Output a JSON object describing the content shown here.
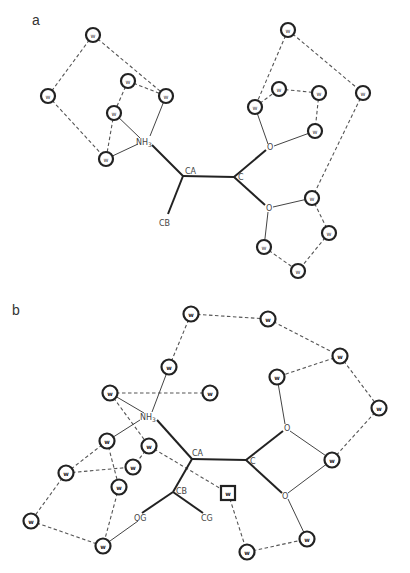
{
  "panels": [
    {
      "label": "a",
      "atoms": {
        "nh3": {
          "text": "NH",
          "sub": "3"
        },
        "ca": "CA",
        "c": "C",
        "cb": "CB",
        "o1": "O",
        "o2": "O"
      },
      "water_label": "w",
      "water_count": 15
    },
    {
      "label": "b",
      "atoms": {
        "nh3": {
          "text": "NH",
          "sub": "3"
        },
        "ca": "CA",
        "c": "C",
        "cb": "CB",
        "og": "OG",
        "cg": "CG",
        "o1": "O",
        "o2": "O"
      },
      "water_label": "w",
      "water_count": 17,
      "special_water_label": "w"
    }
  ]
}
